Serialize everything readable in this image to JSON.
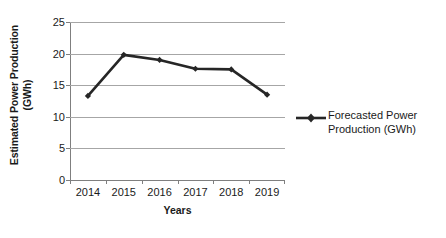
{
  "chart_data": {
    "type": "line",
    "title": "",
    "xlabel": "Years",
    "ylabel": "Estimated Power Production (GWh)",
    "ylabel_line1": "Estimated Power Production",
    "ylabel_line2": "(GWh)",
    "categories": [
      "2014",
      "2015",
      "2016",
      "2017",
      "2018",
      "2019"
    ],
    "x_tick_labels": [
      "2014",
      "2015",
      "2016",
      "2017",
      "2018",
      "2019"
    ],
    "y_tick_labels": [
      "0",
      "5",
      "10",
      "15",
      "20",
      "25"
    ],
    "y_ticks": [
      0,
      5,
      10,
      15,
      20,
      25
    ],
    "ylim": [
      0,
      25
    ],
    "grid": true,
    "legend_position": "right",
    "series": [
      {
        "name": "Forecasted Power Production (GWh)",
        "name_line1": "Forecasted Power",
        "name_line2": "Production (GWh)",
        "color": "#262626",
        "marker": "diamond",
        "values": [
          13.3,
          19.8,
          19.0,
          17.6,
          17.5,
          13.5
        ]
      }
    ]
  },
  "colors": {
    "series_line": "#262626",
    "gridline": "#a6a6a6",
    "axis": "#7f7f7f",
    "text": "#1a1a1a",
    "background": "#ffffff"
  },
  "legend": {
    "marker_name": "line-diamond-marker"
  }
}
